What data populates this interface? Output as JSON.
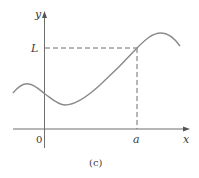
{
  "figure": {
    "caption": "(c)",
    "axes": {
      "x_label": "x",
      "y_label": "y",
      "origin_label": "0"
    },
    "markers": {
      "x_marker_label": "a",
      "y_marker_label": "L"
    },
    "colors": {
      "axis": "#6e6e6e",
      "curve": "#8a8a8a",
      "dashed": "#6e6e6e",
      "text": "#3a3a3a"
    }
  }
}
